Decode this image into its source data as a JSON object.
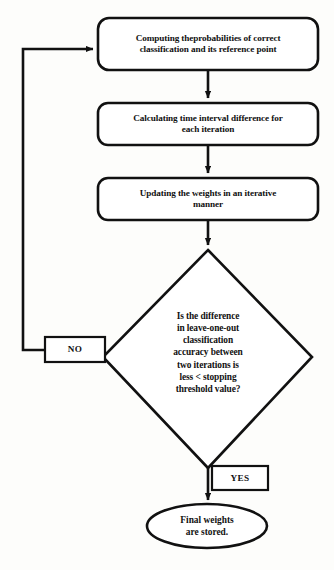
{
  "diagram": {
    "stroke_color": "#111111",
    "fill_color": "#ffffff",
    "background_color": "#fdfdfb",
    "nodes": {
      "process_1": {
        "shape": "rounded-rectangle",
        "text": "Computing theprobabilities of correct\nclassification and its reference point"
      },
      "process_2": {
        "shape": "rounded-rectangle",
        "text": "Calculating time interval difference for\neach iteration"
      },
      "process_3": {
        "shape": "rounded-rectangle",
        "text": "Updating the weights in an iterative\nmanner"
      },
      "decision": {
        "shape": "diamond",
        "text": "Is the difference\nin leave-one-out\nclassification\naccuracy between\ntwo iterations is\nless < stopping\nthreshold value?"
      },
      "terminal_end": {
        "shape": "ellipse",
        "text": "Final weights\nare stored."
      }
    },
    "edge_labels": {
      "no": "NO",
      "yes": "YES"
    }
  }
}
